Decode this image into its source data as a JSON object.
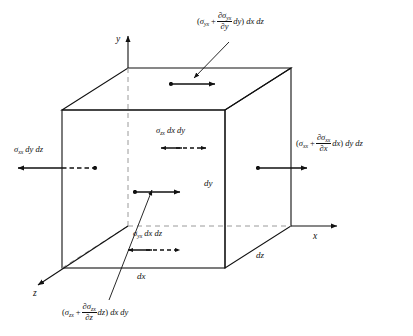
{
  "figure": {
    "type": "stress-element-diagram",
    "background_color": "#ffffff",
    "line_color": "#111111"
  },
  "axes": {
    "x_label": "x",
    "y_label": "y",
    "z_label": "z"
  },
  "dimensions": {
    "dx": "dx",
    "dy": "dy",
    "dz": "dz"
  },
  "labels": {
    "top": {
      "name": "top-face-stress",
      "open_paren": "(",
      "sigma": "σ",
      "sigma_sub": "yx",
      "plus": "+",
      "numer_partial": "∂σ",
      "numer_sub": "yx",
      "denom_partial": "∂",
      "denom_var": "y",
      "times": "dy",
      "close_paren": ")",
      "area": "dx dz"
    },
    "right": {
      "name": "right-face-stress",
      "open_paren": "(",
      "sigma": "σ",
      "sigma_sub": "xx",
      "plus": "+",
      "numer_partial": "∂σ",
      "numer_sub": "xx",
      "denom_partial": "∂",
      "denom_var": "x",
      "times": "dx",
      "close_paren": ")",
      "area": "dy dz"
    },
    "bottom": {
      "name": "front-face-stress",
      "open_paren": "(",
      "sigma": "σ",
      "sigma_sub": "zx",
      "plus": "+",
      "numer_partial": "∂σ",
      "numer_sub": "zx",
      "denom_partial": "∂",
      "denom_var": "z",
      "times": "dz",
      "close_paren": ")",
      "area": "dx dy"
    },
    "left": {
      "name": "left-face-stress",
      "sigma": "σ",
      "sigma_sub": "xx",
      "area": "dy dz"
    },
    "interior_upper": {
      "name": "back-face-stress",
      "sigma": "σ",
      "sigma_sub": "zx",
      "area": "dx dy"
    },
    "interior_lower": {
      "name": "bottom-face-stress",
      "sigma": "σ",
      "sigma_sub": "yx",
      "area": "dx dz"
    }
  }
}
